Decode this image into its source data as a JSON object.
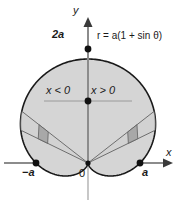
{
  "figure": {
    "name": "cardioid-polar-plot",
    "equation_label": "r = a(1 + sin θ)",
    "axes": {
      "y_label": "y",
      "x_label": "x"
    },
    "labels": {
      "top_value": "2a",
      "left_intercept": "−a",
      "right_intercept": "a",
      "origin": "0",
      "x_negative_region": "x < 0",
      "x_positive_region": "x > 0"
    },
    "colors": {
      "curve_stroke": "#1a1a1a",
      "region_fill": "#d5d5d5",
      "patch_fill": "#a8a8a8",
      "axis_stroke": "#8c8c8c",
      "ray_stroke": "#6e6e6e",
      "point_fill": "#111111",
      "background": "#ffffff"
    }
  },
  "chart_data": {
    "type": "line",
    "title": "",
    "subtitle": "",
    "curve": "cardioid",
    "equation": "r = a(1 + sin θ)",
    "coordinate_system": "polar",
    "xlabel": "x",
    "ylabel": "y",
    "parameter": "a",
    "theta_range_deg": [
      0,
      360
    ],
    "key_points": [
      {
        "label": "2a",
        "theta_deg": 90,
        "r": 2,
        "x": 0,
        "y": 2
      },
      {
        "label": "a",
        "theta_deg": 0,
        "r": 1,
        "x": 1,
        "y": 0
      },
      {
        "label": "−a",
        "theta_deg": 180,
        "r": 1,
        "x": -1,
        "y": 0
      },
      {
        "label": "0",
        "theta_deg": 270,
        "r": 0,
        "x": 0,
        "y": 0
      }
    ],
    "annotations": [
      {
        "text": "x < 0",
        "region": "left half"
      },
      {
        "text": "x > 0",
        "region": "right half"
      },
      {
        "text": "r = a(1 + sin θ)",
        "region": "upper right"
      }
    ],
    "sector_rays_deg": [
      26,
      38,
      142,
      154
    ],
    "grid": false,
    "legend": false,
    "xlim": [
      -1.45,
      1.6
    ],
    "ylim": [
      -0.45,
      2.35
    ]
  }
}
